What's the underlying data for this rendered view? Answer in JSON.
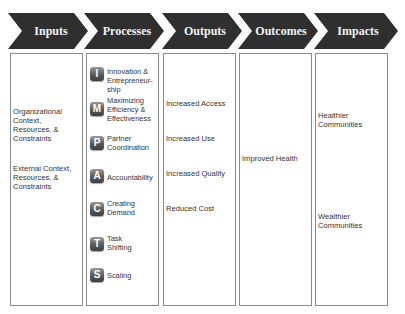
{
  "colors": {
    "chevron_fill": "#2f2f2f",
    "chevron_text": "#f2f2f2",
    "box_border": "#8a8a8a",
    "badge_gradient_top": "#9a9a9a",
    "badge_gradient_bottom": "#3e3e3e"
  },
  "stages": [
    {
      "label": "Inputs"
    },
    {
      "label": "Processes"
    },
    {
      "label": "Outputs"
    },
    {
      "label": "Outcomes"
    },
    {
      "label": "Impacts"
    }
  ],
  "inputs": {
    "items": [
      "Organizational Context, Resources, & Constraints",
      "External Context, Resources, & Constraints"
    ]
  },
  "processes": {
    "items": [
      {
        "letter": "I",
        "label": "Innovation & Entrepreneur-ship",
        "icon": "letter-badge-i"
      },
      {
        "letter": "M",
        "label": "Maximizing Efficiency & Effectiveness",
        "icon": "letter-badge-m"
      },
      {
        "letter": "P",
        "label": "Partner Coordination",
        "icon": "letter-badge-p"
      },
      {
        "letter": "A",
        "label": "Accountability",
        "icon": "letter-badge-a"
      },
      {
        "letter": "C",
        "label": "Creating Demand",
        "icon": "letter-badge-c"
      },
      {
        "letter": "T",
        "label": "Task Shifting",
        "icon": "letter-badge-t"
      },
      {
        "letter": "S",
        "label": "Scaling",
        "icon": "letter-badge-s"
      }
    ]
  },
  "outputs": {
    "items": [
      "Increased Access",
      "Increased Use",
      "Increased Quality",
      "Reduced Cost"
    ]
  },
  "outcomes": {
    "items": [
      "Improved Health"
    ]
  },
  "impacts": {
    "items": [
      "Healthier Communities",
      "Wealthier Communities"
    ]
  }
}
